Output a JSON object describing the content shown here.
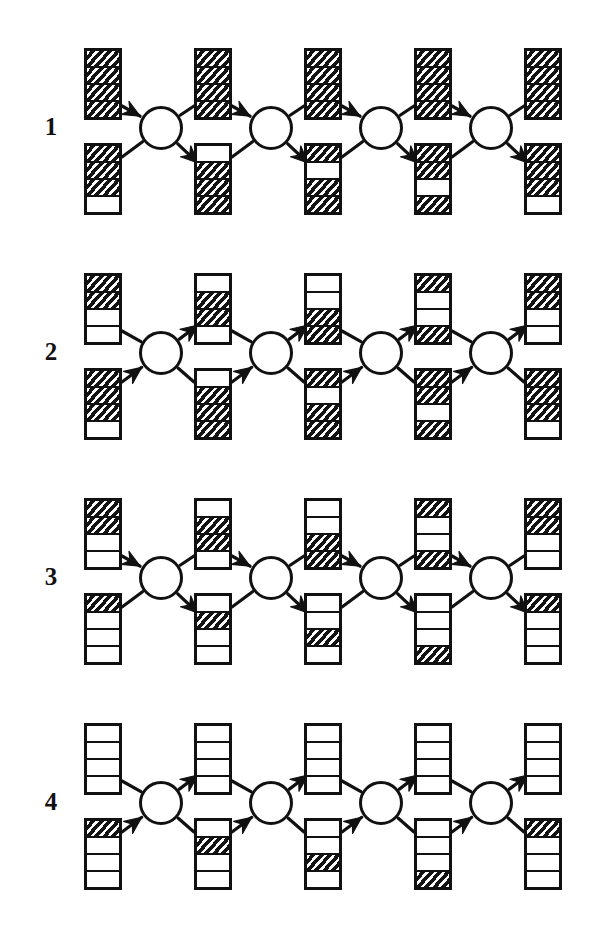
{
  "figure": {
    "type": "diagram",
    "kind": "multi-stage-network-of-hatched-bar-vectors",
    "background_color": "#ffffff",
    "ink_color": "#111111",
    "bar_cells": 4,
    "cell_states": [
      "filled",
      "empty"
    ],
    "bars_per_row": 10,
    "nodes_per_row": 4,
    "columns": 5,
    "arrow_semantics": {
      "odd_rows": "top-left bar points into node; node points down into bottom-right bar",
      "even_rows": "bottom-left bar points into node; node points up into top-right bar"
    }
  },
  "rows": [
    {
      "label": "1",
      "arrow_style": "down",
      "columns": [
        {
          "top": [
            "filled",
            "filled",
            "filled",
            "filled"
          ],
          "bottom": [
            "filled",
            "filled",
            "filled",
            "empty"
          ]
        },
        {
          "top": [
            "filled",
            "filled",
            "filled",
            "filled"
          ],
          "bottom": [
            "empty",
            "filled",
            "filled",
            "filled"
          ]
        },
        {
          "top": [
            "filled",
            "filled",
            "filled",
            "filled"
          ],
          "bottom": [
            "filled",
            "empty",
            "filled",
            "filled"
          ]
        },
        {
          "top": [
            "filled",
            "filled",
            "filled",
            "filled"
          ],
          "bottom": [
            "filled",
            "filled",
            "empty",
            "filled"
          ]
        },
        {
          "top": [
            "filled",
            "filled",
            "filled",
            "filled"
          ],
          "bottom": [
            "filled",
            "filled",
            "filled",
            "empty"
          ]
        }
      ]
    },
    {
      "label": "2",
      "arrow_style": "up",
      "columns": [
        {
          "top": [
            "filled",
            "filled",
            "empty",
            "empty"
          ],
          "bottom": [
            "filled",
            "filled",
            "filled",
            "empty"
          ]
        },
        {
          "top": [
            "empty",
            "filled",
            "filled",
            "empty"
          ],
          "bottom": [
            "empty",
            "filled",
            "filled",
            "filled"
          ]
        },
        {
          "top": [
            "empty",
            "empty",
            "filled",
            "filled"
          ],
          "bottom": [
            "filled",
            "empty",
            "filled",
            "filled"
          ]
        },
        {
          "top": [
            "filled",
            "empty",
            "empty",
            "filled"
          ],
          "bottom": [
            "filled",
            "filled",
            "empty",
            "filled"
          ]
        },
        {
          "top": [
            "filled",
            "filled",
            "empty",
            "empty"
          ],
          "bottom": [
            "filled",
            "filled",
            "filled",
            "empty"
          ]
        }
      ]
    },
    {
      "label": "3",
      "arrow_style": "down",
      "columns": [
        {
          "top": [
            "filled",
            "filled",
            "empty",
            "empty"
          ],
          "bottom": [
            "filled",
            "empty",
            "empty",
            "empty"
          ]
        },
        {
          "top": [
            "empty",
            "filled",
            "filled",
            "empty"
          ],
          "bottom": [
            "empty",
            "filled",
            "empty",
            "empty"
          ]
        },
        {
          "top": [
            "empty",
            "empty",
            "filled",
            "filled"
          ],
          "bottom": [
            "empty",
            "empty",
            "filled",
            "empty"
          ]
        },
        {
          "top": [
            "filled",
            "empty",
            "empty",
            "filled"
          ],
          "bottom": [
            "empty",
            "empty",
            "empty",
            "filled"
          ]
        },
        {
          "top": [
            "filled",
            "filled",
            "empty",
            "empty"
          ],
          "bottom": [
            "filled",
            "empty",
            "empty",
            "empty"
          ]
        }
      ]
    },
    {
      "label": "4",
      "arrow_style": "up",
      "columns": [
        {
          "top": [
            "empty",
            "empty",
            "empty",
            "empty"
          ],
          "bottom": [
            "filled",
            "empty",
            "empty",
            "empty"
          ]
        },
        {
          "top": [
            "empty",
            "empty",
            "empty",
            "empty"
          ],
          "bottom": [
            "empty",
            "filled",
            "empty",
            "empty"
          ]
        },
        {
          "top": [
            "empty",
            "empty",
            "empty",
            "empty"
          ],
          "bottom": [
            "empty",
            "empty",
            "filled",
            "empty"
          ]
        },
        {
          "top": [
            "empty",
            "empty",
            "empty",
            "empty"
          ],
          "bottom": [
            "empty",
            "empty",
            "empty",
            "filled"
          ]
        },
        {
          "top": [
            "empty",
            "empty",
            "empty",
            "empty"
          ],
          "bottom": [
            "filled",
            "empty",
            "empty",
            "empty"
          ]
        }
      ]
    }
  ],
  "geometry": {
    "row_tops": [
      28,
      253,
      478,
      703
    ],
    "column_bar_x": [
      84,
      194,
      304,
      414,
      524
    ],
    "node_x": [
      139,
      249,
      359,
      469
    ],
    "bar_top_y": 20,
    "bar_bottom_y": 115,
    "bar_height": 72,
    "bar_width": 38,
    "node_y": 78,
    "node_size": 44
  }
}
